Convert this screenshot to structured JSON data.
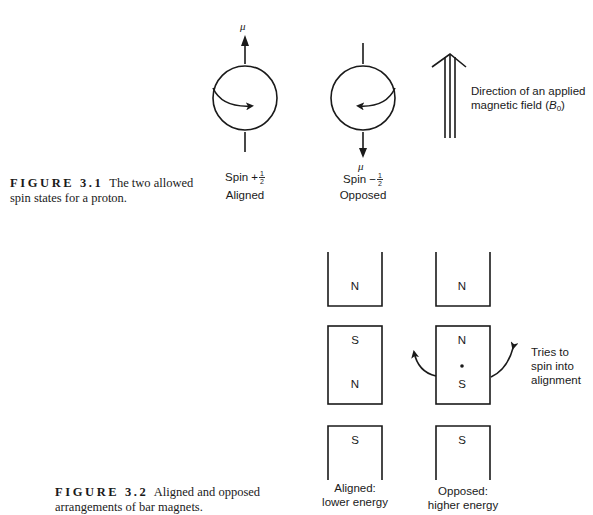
{
  "figure_3_1": {
    "mu_label": "μ",
    "spin_up": {
      "label": "Spin +",
      "fraction_num": "1",
      "fraction_den": "2",
      "state": "Aligned"
    },
    "spin_down": {
      "label": "Spin −",
      "fraction_num": "1",
      "fraction_den": "2",
      "state": "Opposed"
    },
    "field_label_line1": "Direction of an applied",
    "field_label_line2": "magnetic field (",
    "field_symbol": "B",
    "field_subscript": "0",
    "field_label_close": ")",
    "caption_label": "FIGURE 3.1",
    "caption_text": "The two allowed spin states for a proton."
  },
  "figure_3_2": {
    "aligned_column": {
      "top_magnet_pole": "N",
      "middle_magnet_top_pole": "S",
      "middle_magnet_bottom_pole": "N",
      "bottom_magnet_pole": "S",
      "label_line1": "Aligned:",
      "label_line2": "lower energy"
    },
    "opposed_column": {
      "top_magnet_pole": "N",
      "middle_magnet_top_pole": "N",
      "middle_magnet_bottom_pole": "S",
      "bottom_magnet_pole": "S",
      "label_line1": "Opposed:",
      "label_line2": "higher energy"
    },
    "rotation_note_line1": "Tries to",
    "rotation_note_line2": "spin into",
    "rotation_note_line3": "alignment",
    "caption_label": "FIGURE 3.2",
    "caption_text": "Aligned and opposed arrangements of bar magnets."
  },
  "colors": {
    "ink": "#1a1a1a",
    "background": "#ffffff"
  }
}
